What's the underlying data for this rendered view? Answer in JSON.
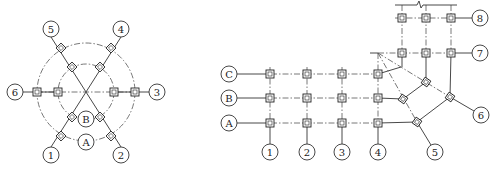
{
  "figure_left": {
    "title": "Radial grid (circular plan)",
    "center": [
      86,
      92
    ],
    "outer_radius": 49,
    "inner_radius": 28,
    "ring_labels": [
      {
        "label": "A",
        "x": 86,
        "y": 142
      },
      {
        "label": "B",
        "x": 86,
        "y": 119
      }
    ],
    "axis_labels": [
      {
        "label": "1",
        "x": 51,
        "y": 155
      },
      {
        "label": "2",
        "x": 121,
        "y": 155
      },
      {
        "label": "3",
        "x": 157,
        "y": 92
      },
      {
        "label": "4",
        "x": 121,
        "y": 29
      },
      {
        "label": "5",
        "x": 51,
        "y": 29
      },
      {
        "label": "6",
        "x": 15,
        "y": 92
      }
    ]
  },
  "figure_right": {
    "title": "Orthogonal + radial grid (L-shaped plan)",
    "row_labels": [
      {
        "label": "C",
        "x": 229,
        "y": 74
      },
      {
        "label": "B",
        "x": 229,
        "y": 98
      },
      {
        "label": "A",
        "x": 229,
        "y": 123
      }
    ],
    "column_labels": [
      {
        "label": "1",
        "x": 270,
        "y": 152
      },
      {
        "label": "2",
        "x": 307,
        "y": 152
      },
      {
        "label": "3",
        "x": 342,
        "y": 152
      },
      {
        "label": "4",
        "x": 378,
        "y": 152
      }
    ],
    "radial_labels": [
      {
        "label": "5",
        "x": 435,
        "y": 152
      },
      {
        "label": "6",
        "x": 481,
        "y": 115
      }
    ],
    "upper_row_labels": [
      {
        "label": "7",
        "x": 480,
        "y": 53
      },
      {
        "label": "8",
        "x": 480,
        "y": 18
      }
    ]
  }
}
